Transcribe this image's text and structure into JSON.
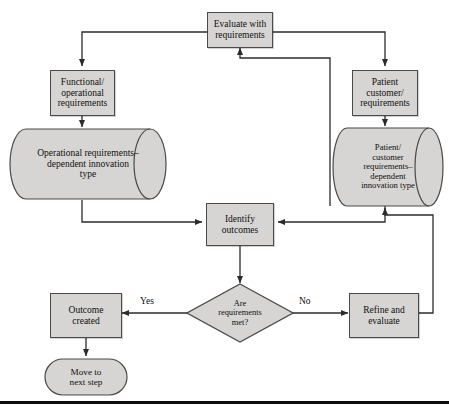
{
  "diagram": {
    "palette": {
      "node_fill": "#d6d5d3",
      "node_stroke": "#4a4a4a",
      "line": "#2b2b2b",
      "text": "#100f0f",
      "background": "#ffffff",
      "base_rule": "#0c0c0c"
    },
    "nodes": [
      {
        "id": "evaluate-with-requirements",
        "shape": "process",
        "label": "Evaluate with\nrequirements"
      },
      {
        "id": "functional-operational-requirements",
        "shape": "process",
        "label": "Functional/\noperational\nrequirements"
      },
      {
        "id": "patient-customer-requirements",
        "shape": "process",
        "label": "Patient\ncustomer/\nrequirements"
      },
      {
        "id": "operational-requirements-dependent-innovation-type",
        "shape": "cylinder",
        "label": "Operational requirements–\ndependent innovation\ntype"
      },
      {
        "id": "patient-customer-requirements-dependent-innovation-type",
        "shape": "cylinder",
        "label": "Patient/\ncustomer\nrequirements–\ndependent\ninnovation type"
      },
      {
        "id": "identify-outcomes",
        "shape": "process",
        "label": "Identify\noutcomes"
      },
      {
        "id": "are-requirements-met",
        "shape": "decision",
        "label": "Are\nrequirements\nmet?"
      },
      {
        "id": "outcome-created",
        "shape": "process",
        "label": "Outcome\ncreated"
      },
      {
        "id": "refine-and-evaluate",
        "shape": "process",
        "label": "Refine and\nevaluate"
      },
      {
        "id": "move-to-next-step",
        "shape": "terminator",
        "label": "Move to\nnext step"
      }
    ],
    "edge_labels": {
      "yes": "Yes",
      "no": "No"
    },
    "connections": [
      {
        "from": "evaluate-with-requirements",
        "to": "functional-operational-requirements",
        "label": ""
      },
      {
        "from": "evaluate-with-requirements",
        "to": "patient-customer-requirements",
        "label": ""
      },
      {
        "from": "functional-operational-requirements",
        "to": "operational-requirements-dependent-innovation-type",
        "label": ""
      },
      {
        "from": "patient-customer-requirements",
        "to": "patient-customer-requirements-dependent-innovation-type",
        "label": ""
      },
      {
        "from": "operational-requirements-dependent-innovation-type",
        "to": "identify-outcomes",
        "label": ""
      },
      {
        "from": "patient-customer-requirements-dependent-innovation-type",
        "to": "identify-outcomes",
        "label": ""
      },
      {
        "from": "patient-customer-requirements-dependent-innovation-type",
        "to": "evaluate-with-requirements",
        "label": ""
      },
      {
        "from": "identify-outcomes",
        "to": "are-requirements-met",
        "label": ""
      },
      {
        "from": "are-requirements-met",
        "to": "outcome-created",
        "label": "Yes"
      },
      {
        "from": "are-requirements-met",
        "to": "refine-and-evaluate",
        "label": "No"
      },
      {
        "from": "refine-and-evaluate",
        "to": "patient-customer-requirements-dependent-innovation-type",
        "label": ""
      },
      {
        "from": "outcome-created",
        "to": "move-to-next-step",
        "label": ""
      }
    ]
  }
}
